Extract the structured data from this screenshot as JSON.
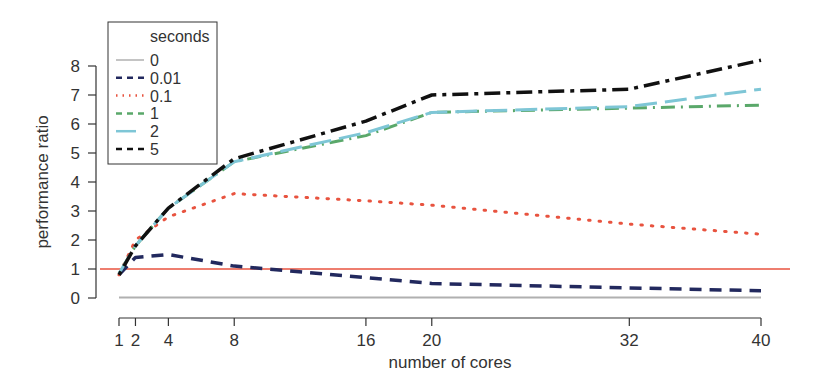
{
  "chart_data": {
    "type": "line",
    "title": "",
    "xlabel": "number of cores",
    "ylabel": "performance ratio",
    "x": [
      1,
      2,
      4,
      8,
      16,
      20,
      32,
      40
    ],
    "xticks": [
      1,
      2,
      4,
      8,
      16,
      20,
      32,
      40
    ],
    "xtick_labels": [
      "1",
      "2",
      "4",
      "8",
      "16",
      "20",
      "32",
      "40"
    ],
    "yticks": [
      0,
      1,
      2,
      3,
      4,
      5,
      6,
      7,
      8
    ],
    "ytick_labels": [
      "0",
      "1",
      "2",
      "3",
      "4",
      "5",
      "6",
      "7",
      "8"
    ],
    "xlim": [
      1,
      40
    ],
    "ylim": [
      0,
      8
    ],
    "grid": false,
    "legend": {
      "title": "seconds",
      "position": "top-left"
    },
    "reference_line": {
      "y": 1,
      "color": "#e8533f"
    },
    "series": [
      {
        "name": "0",
        "color": "#b0b0b0",
        "dash": "solid",
        "values": [
          0.02,
          0.02,
          0.02,
          0.02,
          0.02,
          0.02,
          0.02,
          0.02
        ]
      },
      {
        "name": "0.01",
        "color": "#22295e",
        "dash": "dashed",
        "values": [
          0.8,
          1.4,
          1.5,
          1.1,
          0.7,
          0.5,
          0.35,
          0.25
        ]
      },
      {
        "name": "0.1",
        "color": "#e8533f",
        "dash": "dotted",
        "values": [
          0.8,
          2.0,
          2.8,
          3.6,
          3.35,
          3.2,
          2.55,
          2.2
        ]
      },
      {
        "name": "1",
        "color": "#5aa86a",
        "dash": "dotdash",
        "values": [
          0.85,
          1.8,
          3.1,
          4.7,
          5.6,
          6.4,
          6.55,
          6.65
        ]
      },
      {
        "name": "2",
        "color": "#7ec6d6",
        "dash": "longdash",
        "values": [
          0.85,
          1.8,
          3.1,
          4.7,
          5.7,
          6.4,
          6.6,
          7.2
        ]
      },
      {
        "name": "5",
        "color": "#111111",
        "dash": "twodash",
        "values": [
          0.8,
          1.8,
          3.1,
          4.8,
          6.1,
          7.0,
          7.2,
          8.2
        ]
      }
    ]
  }
}
